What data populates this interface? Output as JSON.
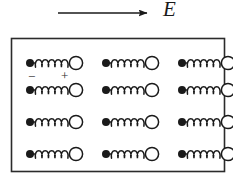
{
  "figure": {
    "type": "physics-diagram",
    "background_color": "#ffffff",
    "ink_color": "#1a1a1a"
  },
  "field_arrow": {
    "label": "E",
    "icon": "arrow-right-icon",
    "direction": "right",
    "x1": 58,
    "y1": 13,
    "x2": 148,
    "y2": 13,
    "color": "#1a1a1a"
  },
  "box": {
    "name": "material-boundary",
    "x": 11,
    "y": 38,
    "width": 214,
    "height": 134,
    "border_color": "#2b2b2b",
    "border_width": 1.5,
    "fill": "#ffffff"
  },
  "dipole": {
    "negative_label": "−",
    "positive_label": "+",
    "negative_icon": "filled-circle-icon",
    "positive_icon": "open-circle-icon",
    "spring_icon": "coil-spring-icon",
    "negative_radius": 4.0,
    "positive_radius": 6.6,
    "coil_turns": 5,
    "length": 46
  },
  "grid": {
    "rows": 4,
    "columns": 3,
    "column_x": [
      30,
      106,
      182
    ],
    "row_y": [
      63,
      90,
      122,
      154
    ],
    "count": 12
  },
  "labeled_dipole": {
    "row": 0,
    "column": 0,
    "minus_x": 28,
    "minus_y": 70,
    "plus_x": 61,
    "plus_y": 69
  }
}
